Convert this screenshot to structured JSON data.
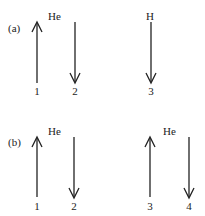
{
  "panels": [
    {
      "label": "(a)",
      "atoms": [
        {
          "symbol": "He"
        },
        {
          "symbol": "H"
        }
      ],
      "electrons": [
        {
          "number": "1",
          "spin": "up"
        },
        {
          "number": "2",
          "spin": "down"
        },
        {
          "number": "3",
          "spin": "down"
        }
      ]
    },
    {
      "label": "(b)",
      "atoms": [
        {
          "symbol": "He"
        },
        {
          "symbol": "He"
        }
      ],
      "electrons": [
        {
          "number": "1",
          "spin": "up"
        },
        {
          "number": "2",
          "spin": "down"
        },
        {
          "number": "3",
          "spin": "up"
        },
        {
          "number": "4",
          "spin": "down"
        }
      ]
    }
  ]
}
